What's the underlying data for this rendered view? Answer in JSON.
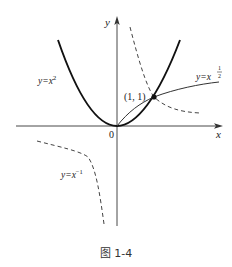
{
  "figure": {
    "caption": "图 1-4",
    "axes": {
      "x_label": "x",
      "y_label": "y",
      "origin_label": "0"
    },
    "point": {
      "label": "(1, 1)",
      "x": 1,
      "y": 1
    },
    "curves": [
      {
        "name": "parabola",
        "label_base": "y=x",
        "label_exp": "2",
        "style": "solid-bold"
      },
      {
        "name": "sqrt",
        "label_base": "y=x",
        "label_exp_num": "1",
        "label_exp_den": "2",
        "style": "solid-thin"
      },
      {
        "name": "reciprocal",
        "label_base": "y=x",
        "label_exp": "−1",
        "style": "dashed"
      }
    ],
    "colors": {
      "stroke": "#222222",
      "background": "#ffffff"
    }
  }
}
